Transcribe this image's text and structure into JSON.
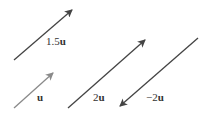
{
  "diagram": {
    "type": "vector-scalar-multiples",
    "vectors": [
      {
        "id": "v-1-5u",
        "label": "1.5u",
        "coef": "1.5",
        "base": "u",
        "color": "#444444",
        "from": [
          14,
          60
        ],
        "to": [
          72,
          10
        ],
        "label_pos": [
          46,
          36
        ]
      },
      {
        "id": "v-u",
        "label": "u",
        "coef": "",
        "base": "u",
        "color": "#8a8a8a",
        "from": [
          14,
          108
        ],
        "to": [
          53,
          73
        ],
        "label_pos": [
          37,
          92
        ]
      },
      {
        "id": "v-2u",
        "label": "2u",
        "coef": "2",
        "base": "u",
        "color": "#444444",
        "from": [
          68,
          108
        ],
        "to": [
          145,
          40
        ],
        "label_pos": [
          93,
          92
        ]
      },
      {
        "id": "v-neg-2u",
        "label": "−2u",
        "coef": "−2",
        "base": "u",
        "color": "#444444",
        "from": [
          198,
          38
        ],
        "to": [
          120,
          106
        ],
        "label_pos": [
          147,
          92
        ]
      }
    ]
  }
}
